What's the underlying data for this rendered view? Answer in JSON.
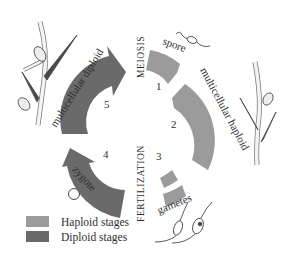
{
  "diagram": {
    "colors": {
      "haploid": "#9b9b9b",
      "diploid": "#6a6a6a",
      "ink": "#2e2e2e"
    },
    "stages": [
      {
        "number": "1",
        "label": "spore",
        "ploidy": "haploid"
      },
      {
        "number": "2",
        "label": "multicellular haploid",
        "ploidy": "haploid"
      },
      {
        "number": "3",
        "label": "gametes",
        "ploidy": "haploid"
      },
      {
        "number": "4",
        "label": "zygote",
        "ploidy": "diploid"
      },
      {
        "number": "5",
        "label": "multicellular diploid",
        "ploidy": "diploid"
      }
    ],
    "events": {
      "meiosis": "MEIOSIS",
      "fertilization": "FERTILIZATION"
    }
  },
  "legend": {
    "items": [
      {
        "label": "Haploid stages",
        "color": "#9b9b9b"
      },
      {
        "label": "Diploid stages",
        "color": "#6a6a6a"
      }
    ]
  }
}
